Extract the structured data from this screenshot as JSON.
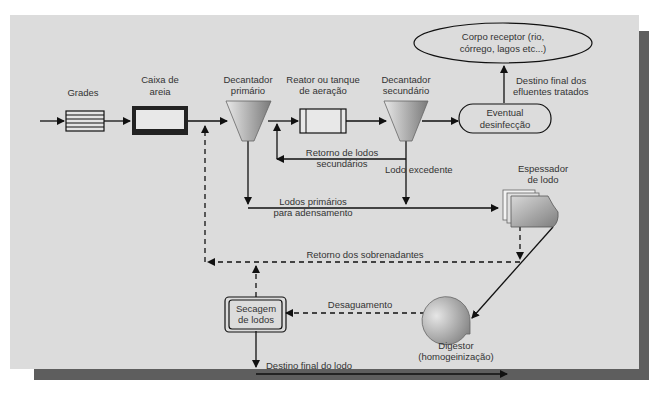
{
  "diagram": {
    "type": "flowchart",
    "colors": {
      "panel": "#dcdcdc",
      "shadow": "#5e5e5e",
      "line": "#222222",
      "text": "#333333",
      "shape_fill_light": "#e6e6e6",
      "shape_fill_dark": "#8a8a8a"
    },
    "nodes": {
      "grades": {
        "label": "Grades"
      },
      "caixa_areia": {
        "label_1": "Caixa de",
        "label_2": "areia"
      },
      "decantador_primario": {
        "label_1": "Decantador",
        "label_2": "primário"
      },
      "reator": {
        "label_1": "Reator ou tanque",
        "label_2": "de aeração"
      },
      "decantador_secundario": {
        "label_1": "Decantador",
        "label_2": "secundário"
      },
      "desinfeccao": {
        "label_1": "Eventual",
        "label_2": "desinfecção"
      },
      "corpo_receptor": {
        "label_1": "Corpo receptor (rio,",
        "label_2": "córrego, lagos etc...)"
      },
      "espessador": {
        "label_1": "Espessador",
        "label_2": "de lodo"
      },
      "digestor": {
        "label_1": "Digestor",
        "label_2": "(homogeinização)"
      },
      "secagem": {
        "label_1": "Secagem",
        "label_2": "de lodos"
      }
    },
    "edges": {
      "destino_efluentes": {
        "label_1": "Destino final dos",
        "label_2": "efluentes tratados"
      },
      "retorno_secundarios": {
        "label_1": "Retorno de lodos",
        "label_2": "secundários"
      },
      "lodo_excedente": {
        "label": "Lodo excedente"
      },
      "lodos_primarios": {
        "label_1": "Lodos primários",
        "label_2": "para adensamento"
      },
      "retorno_sobrenadantes": {
        "label": "Retorno dos sobrenadantes"
      },
      "desaguamento": {
        "label": "Desaguamento"
      },
      "destino_lodo": {
        "label": "Destino final do lodo"
      }
    }
  }
}
